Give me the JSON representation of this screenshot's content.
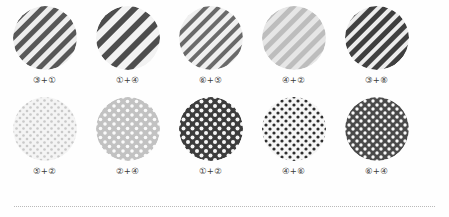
{
  "figure": {
    "name": "pattern-swatch-chart",
    "background": "#fefefe",
    "label_color": "#3a3a3a",
    "rule_color": "#b9b9b9",
    "rows": [
      {
        "row_name": "stripe-row",
        "cells": [
          {
            "label": "③+①",
            "pattern": "diagonal-stripe",
            "fg": "#585858",
            "bg": "#eeeeee",
            "stripe_width": 5,
            "stripe_gap": 5,
            "angle": 45
          },
          {
            "label": "①+④",
            "pattern": "diagonal-stripe",
            "fg": "#4d4d4d",
            "bg": "#f2f2f2",
            "stripe_width": 6,
            "stripe_gap": 7,
            "angle": 45
          },
          {
            "label": "⑥+⑤",
            "pattern": "diagonal-stripe",
            "fg": "#6a6a6a",
            "bg": "#f0f0f0",
            "stripe_width": 4,
            "stripe_gap": 5,
            "angle": 45
          },
          {
            "label": "④+②",
            "pattern": "diagonal-stripe",
            "fg": "#bdbdbd",
            "bg": "#e6e6e6",
            "stripe_width": 5,
            "stripe_gap": 5,
            "angle": 45
          },
          {
            "label": "③+⑧",
            "pattern": "diagonal-stripe",
            "fg": "#3f3f3f",
            "bg": "#ededed",
            "stripe_width": 5,
            "stripe_gap": 4,
            "angle": 45
          }
        ]
      },
      {
        "row_name": "dot-row",
        "cells": [
          {
            "label": "⑤+②",
            "pattern": "polka-dot",
            "fg": "#c9c9c9",
            "bg": "#f4f4f4",
            "dot_radius": 1.3,
            "dot_spacing": 7
          },
          {
            "label": "②+④",
            "pattern": "polka-dot",
            "fg": "#fbfbfb",
            "bg": "#c2c2c2",
            "dot_radius": 1.8,
            "dot_spacing": 9
          },
          {
            "label": "①+②",
            "pattern": "polka-dot",
            "fg": "#f7f7f7",
            "bg": "#3c3c3c",
            "dot_radius": 2.0,
            "dot_spacing": 9
          },
          {
            "label": "④+⑥",
            "pattern": "polka-dot",
            "fg": "#2e2e2e",
            "bg": "#f6f6f6",
            "dot_radius": 1.6,
            "dot_spacing": 8
          },
          {
            "label": "⑥+④",
            "pattern": "polka-dot",
            "fg": "#fafafa",
            "bg": "#4a4a4a",
            "dot_radius": 1.7,
            "dot_spacing": 8
          }
        ]
      }
    ]
  }
}
